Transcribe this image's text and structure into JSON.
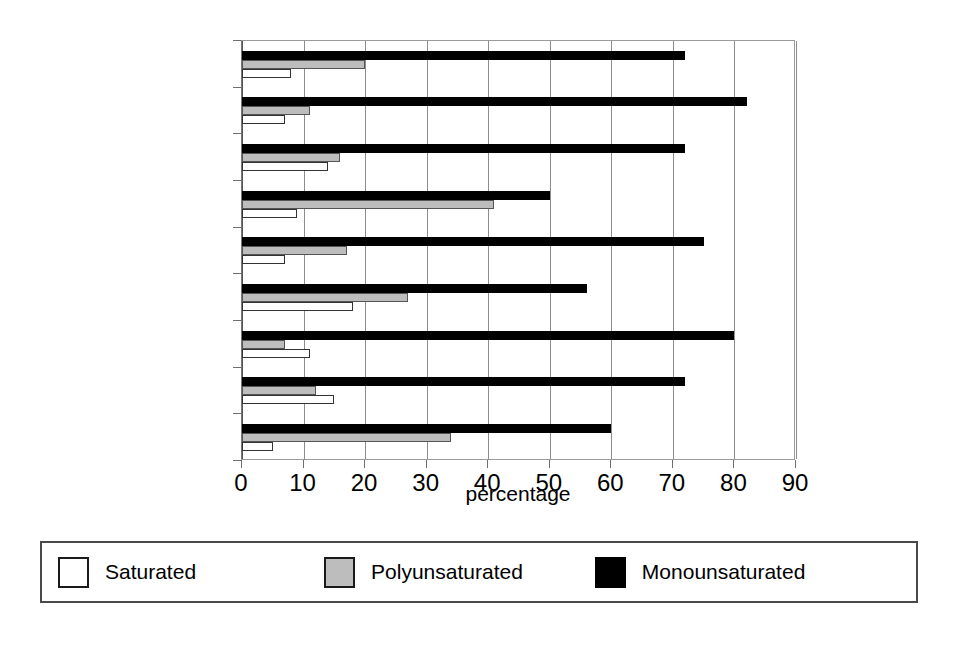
{
  "chart_data": {
    "type": "bar",
    "orientation": "horizontal",
    "title": "",
    "xlabel": "percentage",
    "ylabel": "",
    "xlim": [
      0,
      90
    ],
    "xticks": [
      0,
      10,
      20,
      30,
      40,
      50,
      60,
      70,
      80,
      90
    ],
    "xtick_labels": [
      "0",
      "10",
      "20",
      "30",
      "40",
      "50",
      "60",
      "70",
      "80",
      "90"
    ],
    "grid": true,
    "grid_axis": "x",
    "legend_position": "bottom",
    "categories": [
      "Almonds",
      "Hazelnuts",
      "Pistachios",
      "Sesame",
      "Sunflower, mono",
      "Peanuts",
      "Avocados",
      "Olive oil",
      "Canola oil"
    ],
    "series": [
      {
        "name": "Saturated",
        "color": "#ffffff",
        "values": [
          8,
          7,
          14,
          9,
          7,
          18,
          11,
          15,
          5
        ]
      },
      {
        "name": "Polyunsaturated",
        "color": "#bdbdbd",
        "values": [
          20,
          11,
          16,
          41,
          17,
          27,
          7,
          12,
          34
        ]
      },
      {
        "name": "Monounsaturated",
        "color": "#000000",
        "values": [
          72,
          82,
          72,
          50,
          75,
          56,
          80,
          72,
          60
        ]
      }
    ]
  },
  "legend": {
    "items": [
      {
        "label": "Saturated",
        "swatch": "sat"
      },
      {
        "label": "Polyunsaturated",
        "swatch": "poly"
      },
      {
        "label": "Monounsaturated",
        "swatch": "mono"
      }
    ]
  }
}
